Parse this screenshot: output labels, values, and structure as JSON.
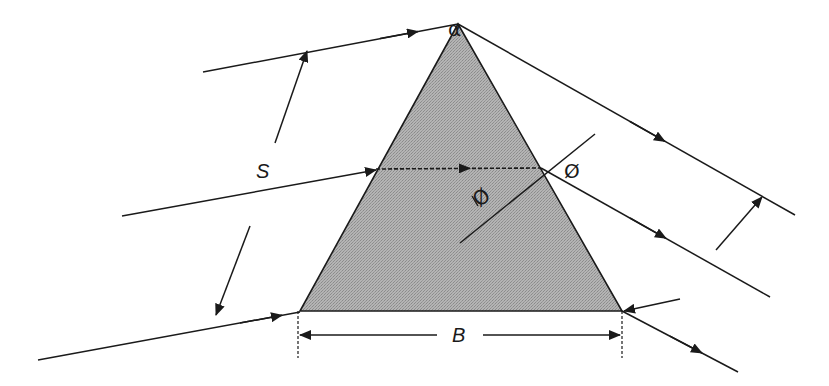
{
  "diagram": {
    "colors": {
      "prism_fill": "#a9a9a9",
      "line": "#1a1a1a",
      "background": "#ffffff"
    },
    "prism": {
      "apex": [
        458,
        24
      ],
      "base_left": [
        300,
        311
      ],
      "base_right": [
        622,
        311
      ],
      "apex_angle_label": "α"
    },
    "labels": {
      "spacing_label": "S",
      "base_label": "B",
      "incidence_angle_label": "Ø",
      "refraction_angle_label": "Ø",
      "apex_angle": "α"
    },
    "rays": [
      {
        "name": "top-incoming-ray",
        "from": [
          203,
          72
        ],
        "to": [
          458,
          24
        ]
      },
      {
        "name": "top-outgoing-ray",
        "from": [
          458,
          24
        ],
        "to": [
          795,
          215
        ]
      },
      {
        "name": "middle-incoming-ray",
        "from": [
          122,
          216
        ],
        "to": [
          376,
          170
        ]
      },
      {
        "name": "middle-internal-ray",
        "from": [
          376,
          169
        ],
        "to": [
          541,
          168
        ],
        "dashed": true
      },
      {
        "name": "middle-outgoing-ray",
        "from": [
          541,
          168
        ],
        "to": [
          770,
          297
        ]
      },
      {
        "name": "bottom-incoming-ray",
        "from": [
          38,
          360
        ],
        "to": [
          300,
          312
        ]
      },
      {
        "name": "bottom-outgoing-ray",
        "from": [
          622,
          311
        ],
        "to": [
          738,
          372
        ]
      },
      {
        "name": "base-right-incoming-ray",
        "from": [
          680,
          299
        ],
        "to": [
          622,
          311
        ]
      }
    ],
    "normal_line": {
      "from": [
        460,
        243
      ],
      "to": [
        595,
        134
      ]
    },
    "dimensions": {
      "S": {
        "upper_arrow": {
          "from": [
            275,
            143
          ],
          "to": [
            307,
            51
          ]
        },
        "lower_arrow": {
          "from": [
            250,
            226
          ],
          "to": [
            216,
            315
          ]
        }
      },
      "right_spacing": {
        "from": [
          716,
          250
        ],
        "to": [
          762,
          197
        ]
      },
      "B": {
        "y": 335,
        "x_left": 300,
        "x_right": 622
      }
    }
  }
}
